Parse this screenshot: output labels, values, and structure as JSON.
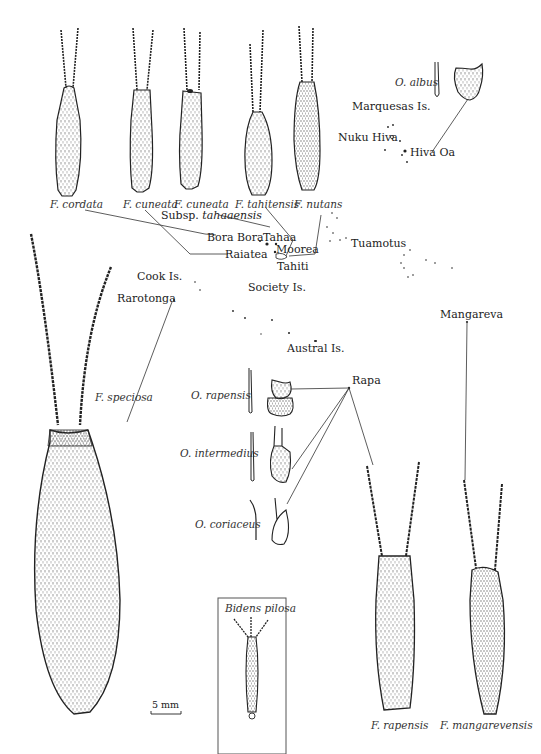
{
  "figure": {
    "type": "taxonomic illustration with island-distribution map",
    "scale_bar": "5 mm",
    "inset_label": "Bidens pilosa"
  },
  "species_top_row": [
    {
      "name": "F. cordata"
    },
    {
      "name": "F. cuneata"
    },
    {
      "name": "F. cuneata"
    },
    {
      "name": "F. tahitensis"
    },
    {
      "name": "F. nutans"
    }
  ],
  "subspecies_label": {
    "prefix": "Subsp.",
    "name": "tahaaensis"
  },
  "species_other": {
    "albus": "O. albus",
    "speciosa": "F. speciosa",
    "rapensis_o": "O. rapensis",
    "intermedius": "O. intermedius",
    "coriaceus": "O. coriaceus",
    "rapensis_f": "F. rapensis",
    "mangarevensis": "F. mangarevensis"
  },
  "places": {
    "marquesas": "Marquesas Is.",
    "nuku_hiva": "Nuku Hiva",
    "hiva_oa": "Hiva Oa",
    "bora_bora": "Bora Bora",
    "tahaa": "Tahaa",
    "raiatea": "Raiatea",
    "moorea": "Moorea",
    "tahiti": "Tahiti",
    "tuamotus": "Tuamotus",
    "cook": "Cook Is.",
    "rarotonga": "Rarotonga",
    "society": "Society Is.",
    "austral": "Austral Is.",
    "rapa": "Rapa",
    "mangareva": "Mangareva"
  },
  "colors": {
    "ink": "#222222",
    "paper": "#ffffff",
    "line": "#333333"
  }
}
